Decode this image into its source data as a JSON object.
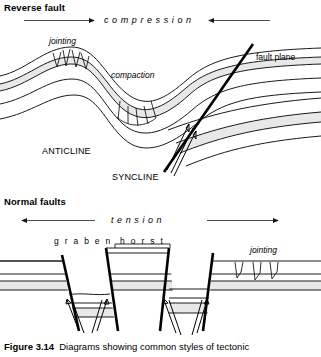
{
  "figure": {
    "caption_number": "Figure 3.14",
    "caption_text": "Diagrams showing common styles of tectonic"
  },
  "panels": {
    "reverse_fault": {
      "heading": "Reverse fault",
      "stress_label": "compression",
      "stress_direction": "inward",
      "annotations": {
        "jointing": "jointing",
        "compaction": "compaction",
        "fault_plane": "fault plane",
        "anticline": "ANTICLINE",
        "syncline": "SYNCLINE"
      }
    },
    "normal_faults": {
      "heading": "Normal faults",
      "stress_label": "tension",
      "stress_direction": "outward",
      "annotations": {
        "graben": "g r a b e n",
        "horst": "h o r s t",
        "jointing": "jointing"
      }
    }
  },
  "colors": {
    "ink": "#1a1a1a",
    "fault_line": "#000000",
    "stratum_shade": "#e8e8e6",
    "background": "#ffffff"
  }
}
